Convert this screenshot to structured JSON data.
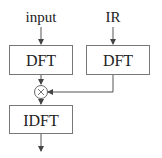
{
  "diagram": {
    "inputs": [
      {
        "id": "input",
        "label": "input"
      },
      {
        "id": "ir",
        "label": "IR"
      }
    ],
    "blocks": [
      {
        "id": "dft_input",
        "label": "DFT"
      },
      {
        "id": "dft_ir",
        "label": "DFT"
      },
      {
        "id": "idft",
        "label": "IDFT"
      }
    ],
    "operator": {
      "id": "multiply",
      "symbol": "×",
      "meaning": "multiply"
    },
    "colors": {
      "stroke": "#555555",
      "text": "#222222",
      "background": "#ffffff"
    }
  }
}
